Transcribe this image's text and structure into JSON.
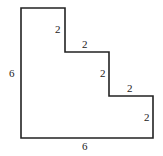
{
  "diagram": {
    "type": "staircase-polygon",
    "stroke_color": "#222222",
    "fill_color": "#ffffff",
    "labels": {
      "left_side": "6",
      "bottom_side": "6",
      "step1_vertical": "2",
      "step1_horizontal": "2",
      "step2_vertical": "2",
      "step2_horizontal": "2",
      "step3_vertical": "2"
    }
  }
}
